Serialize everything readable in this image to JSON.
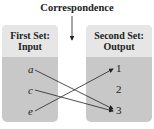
{
  "title": "Correspondence",
  "first_set": {
    "line1": "First Set:",
    "line2": "Input",
    "items": [
      "a",
      "c",
      "e"
    ]
  },
  "second_set": {
    "line1": "Second Set:",
    "line2": "Output",
    "items": [
      "1",
      "2",
      "3"
    ]
  },
  "mappings": [
    {
      "from": "a",
      "to": "3"
    },
    {
      "from": "c",
      "to": "3"
    },
    {
      "from": "e",
      "to": "1"
    }
  ]
}
